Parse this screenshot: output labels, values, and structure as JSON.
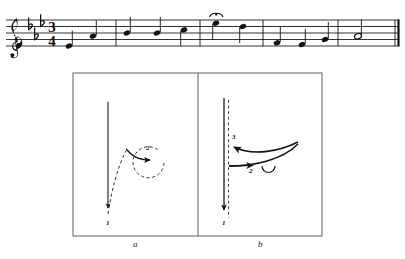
{
  "figure": {
    "background_color": "#ffffff",
    "ink_color": "#111111",
    "frame_color": "#707070"
  },
  "music": {
    "clef": "treble-clef",
    "key_signature": {
      "accidental": "flat",
      "count": 3,
      "name": "E-flat major"
    },
    "time_signature": {
      "numerator": "3",
      "denominator": "4"
    },
    "barline_end": "double-barline",
    "ornaments": [
      {
        "name": "fermata",
        "over_note_index": 5
      }
    ],
    "notes": [
      {
        "index": 0,
        "type": "quarter",
        "staff_step": -1,
        "stem": "up"
      },
      {
        "index": 1,
        "type": "quarter",
        "staff_step": 2,
        "stem": "up"
      },
      {
        "index": 2,
        "type": "quarter",
        "staff_step": 3,
        "stem": "up"
      },
      {
        "index": 3,
        "type": "quarter",
        "staff_step": 5,
        "stem": "down"
      },
      {
        "index": 4,
        "type": "quarter",
        "staff_step": 6,
        "stem": "down"
      },
      {
        "index": 5,
        "type": "quarter",
        "staff_step": 7,
        "stem": "down"
      },
      {
        "index": 6,
        "type": "quarter",
        "staff_step": 5,
        "stem": "down"
      },
      {
        "index": 7,
        "type": "quarter",
        "staff_step": 0,
        "stem": "up"
      },
      {
        "index": 8,
        "type": "quarter",
        "staff_step": 1,
        "stem": "up"
      },
      {
        "index": 9,
        "type": "quarter",
        "staff_step": 3,
        "stem": "up"
      },
      {
        "index": 10,
        "type": "half",
        "staff_step": 2,
        "stem": "up"
      }
    ]
  },
  "diagram": {
    "panels": [
      {
        "id": "a",
        "caption": "a",
        "description": "two-beat conducting pattern",
        "strokes": [
          {
            "beat": "1",
            "label": "1",
            "style": "solid",
            "direction": "down"
          },
          {
            "beat": "2",
            "label": "2",
            "style": "dashed-loop",
            "direction": "up-right"
          }
        ]
      },
      {
        "id": "b",
        "caption": "b",
        "description": "three-beat conducting pattern",
        "strokes": [
          {
            "beat": "1",
            "label": "1",
            "style": "solid",
            "direction": "down"
          },
          {
            "beat": "2",
            "label": "2",
            "style": "solid",
            "direction": "right"
          },
          {
            "beat": "3",
            "label": "3",
            "style": "solid",
            "direction": "up-left"
          }
        ]
      }
    ]
  }
}
